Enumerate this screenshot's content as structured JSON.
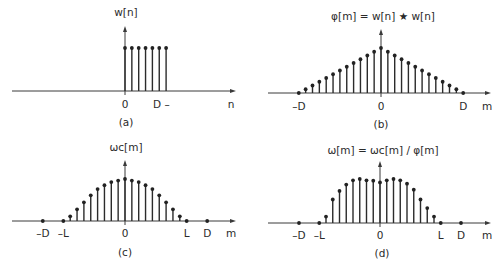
{
  "figure": {
    "panels": [
      {
        "id": "a",
        "caption": "(a)",
        "title": "w[n]",
        "axis_var": "n",
        "ticks": [
          {
            "label": "0",
            "pos": 0
          },
          {
            "label": "D –",
            "pos": 5.3
          }
        ],
        "geom": {
          "x0": 125,
          "y0": 91,
          "unit": 6.85,
          "xmin": 12,
          "xmax": 236,
          "ytop": 26,
          "hmax": 43,
          "title_x": 126,
          "title_y": 16,
          "tick_y": 108,
          "var_x": 231,
          "cap_x": 126,
          "cap_y": 126
        }
      },
      {
        "id": "b",
        "caption": "(b)",
        "title": "φ[m] = w[n] ★ w[n]",
        "axis_var": "m",
        "ticks": [
          {
            "label": "–D",
            "pos": -12
          },
          {
            "label": "0",
            "pos": 0
          },
          {
            "label": "D",
            "pos": 12
          }
        ],
        "geom": {
          "x0": 381,
          "y0": 93,
          "unit": 6.85,
          "xmin": 268,
          "xmax": 491,
          "ytop": 29,
          "hmax": 45,
          "title_x": 383,
          "title_y": 20,
          "tick_y": 110,
          "var_x": 487,
          "cap_x": 381,
          "cap_y": 128
        }
      },
      {
        "id": "c",
        "caption": "(c)",
        "title": "ωc[m]",
        "axis_var": "m",
        "ticks": [
          {
            "label": "–D",
            "pos": -12
          },
          {
            "label": "–L",
            "pos": -9
          },
          {
            "label": "0",
            "pos": 0
          },
          {
            "label": "L",
            "pos": 9
          },
          {
            "label": "D",
            "pos": 12
          }
        ],
        "geom": {
          "x0": 125,
          "y0": 221,
          "unit": 6.85,
          "xmin": 12,
          "xmax": 236,
          "ytop": 160,
          "hmax": 42,
          "title_x": 126,
          "title_y": 151,
          "tick_y": 237,
          "var_x": 231,
          "cap_x": 125,
          "cap_y": 256
        }
      },
      {
        "id": "d",
        "caption": "(d)",
        "title": "ω[m] = ωc[m] / φ[m]",
        "axis_var": "m",
        "ticks": [
          {
            "label": "–D",
            "pos": -12
          },
          {
            "label": "–L",
            "pos": -9
          },
          {
            "label": "0",
            "pos": 0
          },
          {
            "label": "L",
            "pos": 9
          },
          {
            "label": "D",
            "pos": 12
          }
        ],
        "geom": {
          "x0": 380,
          "y0": 223,
          "unit": 6.75,
          "xmin": 268,
          "xmax": 491,
          "ytop": 161,
          "hmax": 44,
          "title_x": 383,
          "title_y": 154,
          "tick_y": 239,
          "var_x": 487,
          "cap_x": 382,
          "cap_y": 257
        }
      }
    ]
  },
  "chart_data": [
    {
      "type": "stem",
      "title": "w[n]",
      "caption": "(a)",
      "xlabel": "n",
      "x": [
        0,
        1,
        2,
        3,
        4,
        5,
        6
      ],
      "values": [
        1,
        1,
        1,
        1,
        1,
        1,
        1
      ],
      "tick_labels": [
        "0",
        "D –"
      ],
      "grid": false
    },
    {
      "type": "stem",
      "title": "φ[m] = w[n] ★ w[n]",
      "caption": "(b)",
      "xlabel": "m",
      "x": [
        -12,
        -11,
        -10,
        -9,
        -8,
        -7,
        -6,
        -5,
        -4,
        -3,
        -2,
        -1,
        0,
        1,
        2,
        3,
        4,
        5,
        6,
        7,
        8,
        9,
        10,
        11,
        12
      ],
      "values": [
        0,
        0.077,
        0.154,
        0.231,
        0.308,
        0.385,
        0.462,
        0.538,
        0.615,
        0.692,
        0.769,
        0.846,
        0.923,
        0.846,
        0.769,
        0.692,
        0.615,
        0.538,
        0.462,
        0.385,
        0.308,
        0.231,
        0.154,
        0.077,
        0
      ],
      "tick_labels": [
        "–D",
        "0",
        "D"
      ],
      "grid": false
    },
    {
      "type": "stem",
      "title": "ωc[m]",
      "caption": "(c)",
      "xlabel": "m",
      "x": [
        -12,
        -9,
        -8,
        -7,
        -6,
        -5,
        -4,
        -3,
        -2,
        -1,
        0,
        1,
        2,
        3,
        4,
        5,
        6,
        7,
        8,
        9,
        12
      ],
      "values": [
        0,
        0,
        0.12,
        0.3,
        0.48,
        0.66,
        0.82,
        0.92,
        1.0,
        1.04,
        1.08,
        1.04,
        1.0,
        0.92,
        0.82,
        0.66,
        0.48,
        0.3,
        0.12,
        0,
        0
      ],
      "tick_labels": [
        "–D",
        "–L",
        "0",
        "L",
        "D"
      ],
      "grid": false
    },
    {
      "type": "stem",
      "title": "ω[m] = ωc[m] / φ[m]",
      "caption": "(d)",
      "xlabel": "m",
      "x": [
        -12,
        -9,
        -8,
        -7,
        -6,
        -5,
        -4,
        -3,
        -2,
        -1,
        0,
        1,
        2,
        3,
        4,
        5,
        6,
        7,
        8,
        9,
        12
      ],
      "values": [
        0,
        0,
        0.15,
        0.55,
        0.75,
        0.9,
        1.0,
        1.03,
        1.0,
        0.99,
        0.95,
        1.0,
        1.03,
        1.0,
        0.92,
        0.78,
        0.55,
        0.35,
        0.15,
        0,
        0
      ],
      "tick_labels": [
        "–D",
        "–L",
        "0",
        "L",
        "D"
      ],
      "grid": false
    }
  ]
}
